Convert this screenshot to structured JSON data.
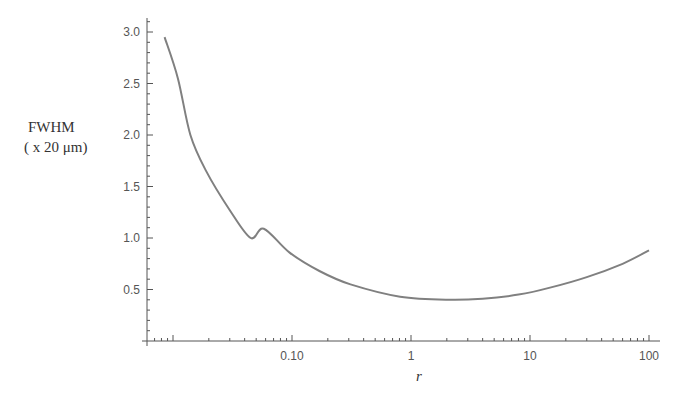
{
  "chart_data": {
    "type": "line",
    "title": "",
    "xlabel": "r",
    "ylabel_line1": "FWHM",
    "ylabel_line2": "( x 20 μm)",
    "xscale": "log",
    "xlim": [
      0.0075,
      110
    ],
    "ylim": [
      0,
      3.1
    ],
    "grid": false,
    "legend": null,
    "x_ticks": [
      {
        "value": 0.1,
        "label": "0.10"
      },
      {
        "value": 1,
        "label": "1"
      },
      {
        "value": 10,
        "label": "10"
      },
      {
        "value": 100,
        "label": "100"
      }
    ],
    "y_ticks": [
      {
        "value": 0.5,
        "label": "0.5"
      },
      {
        "value": 1.0,
        "label": "1.0"
      },
      {
        "value": 1.5,
        "label": "1.5"
      },
      {
        "value": 2.0,
        "label": "2.0"
      },
      {
        "value": 2.5,
        "label": "2.5"
      },
      {
        "value": 3.0,
        "label": "3.0"
      }
    ],
    "series": [
      {
        "name": "FWHM",
        "color": "#808080",
        "x": [
          0.0085,
          0.011,
          0.014,
          0.019,
          0.03,
          0.045,
          0.058,
          0.095,
          0.17,
          0.31,
          0.81,
          2.1,
          4.0,
          8.0,
          15,
          30,
          60,
          100
        ],
        "values": [
          2.95,
          2.55,
          2.0,
          1.65,
          1.27,
          1.0,
          1.09,
          0.86,
          0.68,
          0.55,
          0.43,
          0.4,
          0.41,
          0.45,
          0.52,
          0.62,
          0.75,
          0.88
        ]
      }
    ]
  }
}
